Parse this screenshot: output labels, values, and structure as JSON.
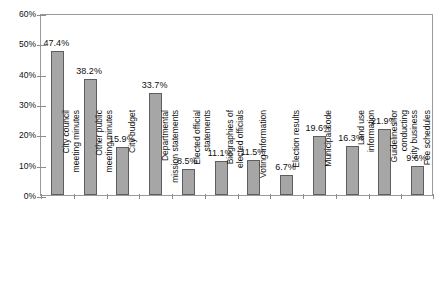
{
  "chart_data": {
    "type": "bar",
    "title": "",
    "xlabel": "",
    "ylabel": "",
    "ylim": [
      0,
      60
    ],
    "ytick_labels": [
      "0%",
      "10%",
      "20%",
      "30%",
      "40%",
      "50%",
      "60%"
    ],
    "ytick_values": [
      0,
      10,
      20,
      30,
      40,
      50,
      60
    ],
    "grid": false,
    "legend": "none",
    "value_suffix": "%",
    "categories": [
      "City council\nmeeting minutes",
      "Other public\nmeeting minutes",
      "City budget",
      "Departmental\nmission statements",
      "Elected official\nstatements",
      "Biographies of\nelected officials",
      "Voting information",
      "Election results",
      "Municipal code",
      "Land use\ninformation",
      "Guidelines for\nconducting\ncity business",
      "Fee schedules"
    ],
    "values": [
      47.4,
      38.2,
      15.9,
      33.7,
      8.5,
      11.1,
      11.5,
      6.7,
      19.6,
      16.3,
      21.9,
      9.6
    ],
    "value_labels": [
      "47.4%",
      "38.2%",
      "15.9%",
      "33.7%",
      "8.5%",
      "11.1%",
      "11.5%",
      "6.7%",
      "19.6%",
      "16.3%",
      "21.9%",
      "9.6%"
    ],
    "bar_fill_color": "#a6a6a6",
    "bar_border_color": "#5e5e5e",
    "axis_color": "#9a9a9a",
    "text_color": "#111111"
  }
}
